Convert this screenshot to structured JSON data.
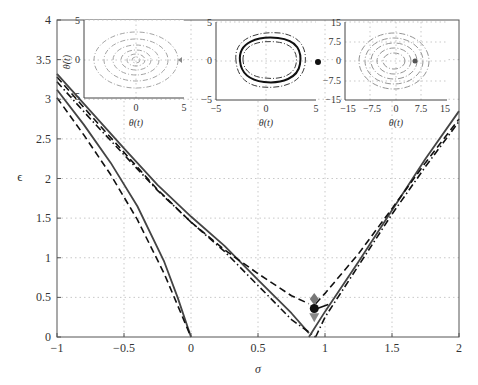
{
  "chart_data": {
    "type": "line",
    "title": "",
    "xlabel": "σ",
    "ylabel": "ϵ",
    "xlim": [
      -1,
      2
    ],
    "ylim": [
      0,
      4
    ],
    "grid": true,
    "xticks": [
      "−1",
      "−0.5",
      "0",
      "0.5",
      "1",
      "1.5",
      "2"
    ],
    "yticks": [
      "0",
      "0.5",
      "1",
      "1.5",
      "2",
      "2.5",
      "3",
      "3.5",
      "4"
    ],
    "series": [
      {
        "name": "upper-left-solid",
        "style": "solid",
        "color": "#444444",
        "x": [
          -1,
          -0.75,
          -0.5,
          -0.25,
          0,
          0.25,
          0.5,
          0.75,
          0.88
        ],
        "y": [
          3.32,
          2.85,
          2.38,
          1.92,
          1.52,
          1.15,
          0.72,
          0.3,
          0.05
        ]
      },
      {
        "name": "upper-left-dashed",
        "style": "dashed",
        "color": "#111111",
        "x": [
          -1,
          -0.75,
          -0.5,
          -0.25,
          0,
          0.25,
          0.5,
          0.75,
          0.88
        ],
        "y": [
          3.28,
          2.8,
          2.33,
          1.86,
          1.45,
          1.1,
          0.8,
          0.52,
          0.42
        ]
      },
      {
        "name": "upper-left-dashdot",
        "style": "dashdot",
        "color": "#111111",
        "x": [
          -1,
          -0.75,
          -0.5,
          -0.25,
          0,
          0.25,
          0.5,
          0.75,
          0.93
        ],
        "y": [
          3.22,
          2.75,
          2.3,
          1.85,
          1.45,
          1.08,
          0.65,
          0.22,
          0.0
        ]
      },
      {
        "name": "inner-left-solid",
        "style": "solid",
        "color": "#444444",
        "x": [
          -1,
          -0.8,
          -0.6,
          -0.4,
          -0.2,
          -0.1,
          0
        ],
        "y": [
          3.12,
          2.68,
          2.2,
          1.65,
          0.95,
          0.5,
          0.0
        ]
      },
      {
        "name": "inner-left-dashed",
        "style": "dashed",
        "color": "#111111",
        "x": [
          -1,
          -0.8,
          -0.6,
          -0.4,
          -0.2,
          -0.1,
          0
        ],
        "y": [
          3.02,
          2.55,
          2.05,
          1.48,
          0.8,
          0.4,
          0.0
        ]
      },
      {
        "name": "right-solid",
        "style": "solid",
        "color": "#444444",
        "x": [
          0.88,
          1.0,
          1.25,
          1.5,
          1.75,
          2.0
        ],
        "y": [
          0.0,
          0.32,
          0.95,
          1.6,
          2.25,
          2.85
        ]
      },
      {
        "name": "right-dashed",
        "style": "dashed",
        "color": "#111111",
        "x": [
          0.93,
          1.0,
          1.25,
          1.5,
          1.75,
          2.0
        ],
        "y": [
          0.42,
          0.55,
          1.05,
          1.62,
          2.2,
          2.75
        ]
      },
      {
        "name": "right-dashdot",
        "style": "dashdot",
        "color": "#111111",
        "x": [
          0.93,
          1.0,
          1.25,
          1.5,
          1.75,
          2.0
        ],
        "y": [
          0.0,
          0.25,
          0.9,
          1.55,
          2.15,
          2.72
        ]
      }
    ],
    "markers": [
      {
        "shape": "diamond",
        "x": 0.92,
        "y": 0.48,
        "color": "#777777"
      },
      {
        "shape": "circle",
        "x": 0.92,
        "y": 0.36,
        "color": "#111111"
      },
      {
        "shape": "triangle-down",
        "x": 0.92,
        "y": 0.25,
        "color": "#888888"
      }
    ],
    "insets": [
      {
        "name": "inset-1",
        "xlabel": "θ(t)",
        "ylabel": "θ̇(t)",
        "xticks": [
          "0",
          "5"
        ],
        "yticks": [
          "5",
          "0",
          "−5"
        ],
        "content": "spiral converging to origin (gray dash-dot)"
      },
      {
        "name": "inset-2",
        "xlabel": "θ(t)",
        "ylabel": "",
        "xticks": [
          "−5",
          "0",
          "5"
        ],
        "yticks": [
          "5",
          "0",
          "−5"
        ],
        "content": "limit cycle (solid) with dash-dot orbits"
      },
      {
        "name": "inset-3",
        "xlabel": "θ(t)",
        "ylabel": "",
        "xticks": [
          "−15",
          "−7.5",
          "0",
          "7.5",
          "15"
        ],
        "yticks": [
          "15",
          "7.5",
          "0",
          "−7.5",
          "−15"
        ],
        "content": "growing spiral (gray dash-dot)"
      }
    ]
  }
}
